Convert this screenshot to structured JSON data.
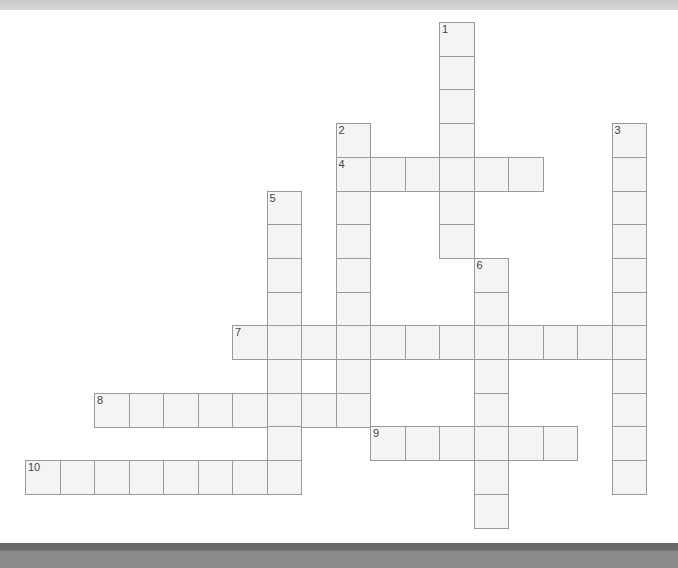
{
  "puzzle": {
    "type": "crossword",
    "grid": {
      "origin_x": 25,
      "origin_y": 22,
      "pitch_x": 34.5,
      "pitch_y": 33.7
    },
    "words": [
      {
        "number": "1",
        "direction": "down",
        "row": 0,
        "col": 12,
        "length": 7
      },
      {
        "number": "2",
        "direction": "down",
        "row": 3,
        "col": 9,
        "length": 9
      },
      {
        "number": "3",
        "direction": "down",
        "row": 3,
        "col": 17,
        "length": 11
      },
      {
        "number": "4",
        "direction": "across",
        "row": 4,
        "col": 9,
        "length": 6
      },
      {
        "number": "5",
        "direction": "down",
        "row": 5,
        "col": 7,
        "length": 9
      },
      {
        "number": "6",
        "direction": "down",
        "row": 7,
        "col": 13,
        "length": 8
      },
      {
        "number": "7",
        "direction": "across",
        "row": 9,
        "col": 6,
        "length": 12
      },
      {
        "number": "8",
        "direction": "across",
        "row": 11,
        "col": 2,
        "length": 8
      },
      {
        "number": "9",
        "direction": "across",
        "row": 12,
        "col": 10,
        "length": 6
      },
      {
        "number": "10",
        "direction": "across",
        "row": 13,
        "col": 0,
        "length": 8
      }
    ]
  },
  "colors": {
    "cell_fill": "#f4f4f4",
    "cell_border": "#9a9a9a",
    "number_text": "#444444",
    "top_band": "#d0d0d0",
    "bottom_band": "#8a8a8a"
  }
}
